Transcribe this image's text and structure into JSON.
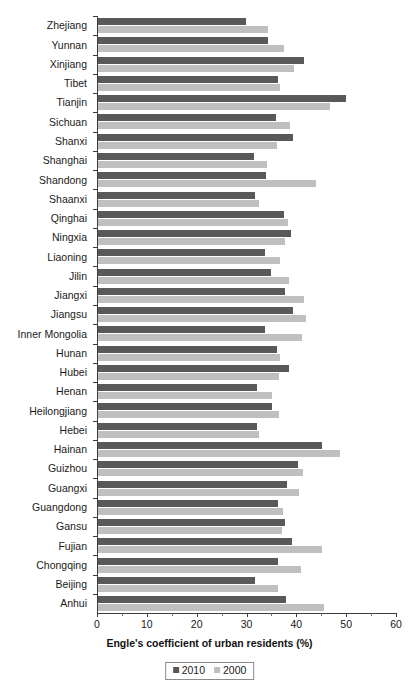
{
  "chart_data": {
    "type": "bar",
    "orientation": "horizontal",
    "title": "",
    "xlabel": "Engle's coefficient of urban residents (%)",
    "ylabel": "",
    "xlim": [
      0,
      60
    ],
    "xticks": [
      0,
      10,
      20,
      30,
      40,
      50,
      60
    ],
    "xticklabels": [
      "0",
      "10",
      "20",
      "30",
      "40",
      "50",
      "60"
    ],
    "grid": false,
    "legend_position": "bottom-center",
    "categories": [
      "Zhejiang",
      "Yunnan",
      "Xinjiang",
      "Tibet",
      "Tianjin",
      "Sichuan",
      "Shanxi",
      "Shanghai",
      "Shandong",
      "Shaanxi",
      "Qinghai",
      "Ningxia",
      "Liaoning",
      "Jilin",
      "Jiangxi",
      "Jiangsu",
      "Inner Mongolia",
      "Hunan",
      "Hubei",
      "Henan",
      "Heilongjiang",
      "Hebei",
      "Hainan",
      "Guizhou",
      "Guangxi",
      "Guangdong",
      "Gansu",
      "Fujian",
      "Chongqing",
      "Beijing",
      "Anhui"
    ],
    "series": [
      {
        "name": "2010",
        "color": "#595959",
        "values": [
          29.7,
          34.3,
          41.4,
          36.3,
          50.0,
          35.9,
          39.3,
          31.5,
          33.9,
          31.7,
          37.4,
          38.9,
          33.6,
          34.8,
          37.6,
          39.2,
          33.6,
          36.1,
          38.5,
          32.1,
          35.0,
          32.0,
          45.2,
          40.2,
          38.1,
          36.3,
          37.6,
          39.1,
          36.3,
          31.6,
          37.8
        ]
      },
      {
        "name": "2000",
        "color": "#bfbfbf",
        "values": [
          34.3,
          37.5,
          39.5,
          36.6,
          46.8,
          38.6,
          36.1,
          34.0,
          43.8,
          32.4,
          38.3,
          37.6,
          36.6,
          38.5,
          41.5,
          41.8,
          41.0,
          36.6,
          36.4,
          35.0,
          36.5,
          32.4,
          48.8,
          41.3,
          40.4,
          37.2,
          37.1,
          45.2,
          40.9,
          36.3,
          45.5
        ]
      }
    ]
  },
  "legend": {
    "items": [
      {
        "label": "2010",
        "color": "#595959"
      },
      {
        "label": "2000",
        "color": "#bfbfbf"
      }
    ]
  }
}
